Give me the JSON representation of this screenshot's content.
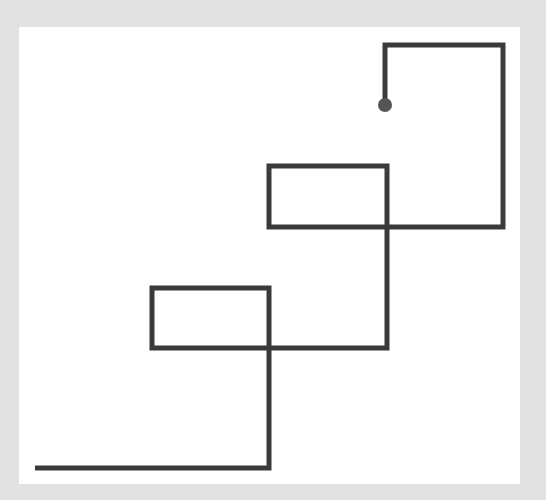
{
  "diagram": {
    "background": "#e2e2e2",
    "canvas_color": "#ffffff",
    "line_color": "#3a3a3a",
    "line_width": 5,
    "path_points": [
      [
        35,
        468
      ],
      [
        269,
        468
      ],
      [
        269,
        288
      ],
      [
        152,
        288
      ],
      [
        152,
        348
      ],
      [
        387,
        348
      ],
      [
        387,
        166
      ],
      [
        269,
        166
      ],
      [
        269,
        227
      ],
      [
        503,
        227
      ],
      [
        503,
        45
      ],
      [
        385,
        45
      ],
      [
        385,
        105
      ]
    ],
    "end_dot": {
      "cx": 385,
      "cy": 105,
      "r": 7,
      "color": "#555555"
    }
  }
}
